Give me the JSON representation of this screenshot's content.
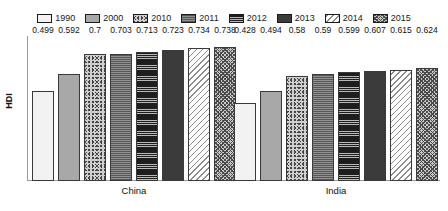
{
  "chart_data": {
    "type": "bar",
    "title": "",
    "subtitle": "",
    "xlabel": "",
    "ylabel": "HDI",
    "categories": [
      "China",
      "India"
    ],
    "ylim": [
      0,
      0.8
    ],
    "grid": false,
    "legend_position": "top-center",
    "series": [
      {
        "name": "1990",
        "values": [
          0.499,
          0.428
        ],
        "pattern": "solid-white"
      },
      {
        "name": "2000",
        "values": [
          0.592,
          0.494
        ],
        "pattern": "solid-gray"
      },
      {
        "name": "2010",
        "values": [
          0.7,
          0.58
        ],
        "pattern": "speckled"
      },
      {
        "name": "2011",
        "values": [
          0.703,
          0.59
        ],
        "pattern": "horizontal-lines-gray"
      },
      {
        "name": "2012",
        "values": [
          0.713,
          0.599
        ],
        "pattern": "dark-horizontal-lines"
      },
      {
        "name": "2013",
        "values": [
          0.723,
          0.607
        ],
        "pattern": "solid-dark-gray"
      },
      {
        "name": "2014",
        "values": [
          0.734,
          0.615
        ],
        "pattern": "diagonal-lines"
      },
      {
        "name": "2015",
        "values": [
          0.738,
          0.624
        ],
        "pattern": "cross-hatch"
      }
    ],
    "data_labels": {
      "China": [
        "0.499",
        "0.592",
        "0.7",
        "0.703",
        "0.713",
        "0.723",
        "0.734",
        "0.738"
      ],
      "India": [
        "0.428",
        "0.494",
        "0.58",
        "0.59",
        "0.599",
        "0.607",
        "0.615",
        "0.624"
      ]
    }
  },
  "legend": {
    "items": [
      {
        "label": "1990"
      },
      {
        "label": "2000"
      },
      {
        "label": "2010"
      },
      {
        "label": "2011"
      },
      {
        "label": "2012"
      },
      {
        "label": "2013"
      },
      {
        "label": "2014"
      },
      {
        "label": "2015"
      }
    ]
  },
  "axis": {
    "y_title": "HDI"
  },
  "colors": {
    "axis_line": "#9a9a9a",
    "bar_border": "#3a3a3a",
    "text": "#111111",
    "background": "#ffffff"
  }
}
